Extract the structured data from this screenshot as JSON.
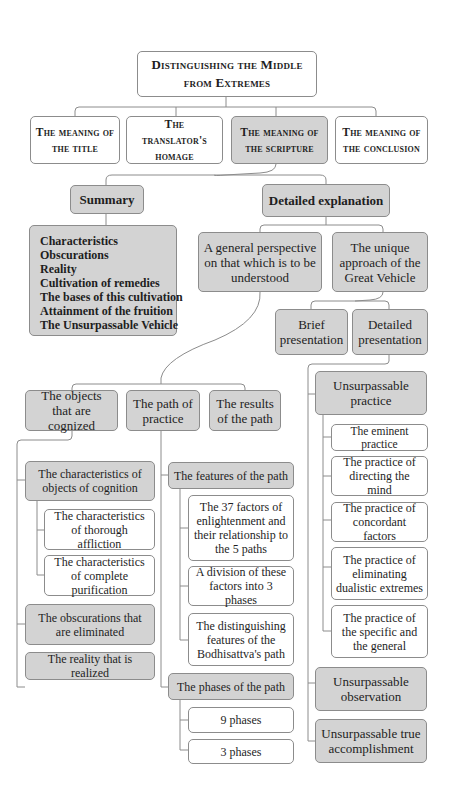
{
  "title": "Distinguishing the Middle from Extremes",
  "level1": [
    {
      "label": "The meaning of the title"
    },
    {
      "label": "The translator's homage"
    },
    {
      "label": "The meaning of the scripture"
    },
    {
      "label": "The meaning of the conclusion"
    }
  ],
  "scripture": {
    "summary": {
      "label": "Summary",
      "items": [
        "Characteristics",
        "Obscurations",
        "Reality",
        "Cultivation of remedies",
        "The bases of this cultivation",
        "Attainment of the fruition",
        "The Unsurpassable Vehicle"
      ]
    },
    "detailed": {
      "label": "Detailed explanation",
      "general": {
        "label": "A general perspective on that which is to be understood",
        "objects": {
          "label": "The objects that are cognized",
          "children": [
            {
              "label": "The characteristics of objects of cognition",
              "children": [
                {
                  "label": "The characteristics of thorough affliction"
                },
                {
                  "label": "The characteristics of complete purification"
                }
              ]
            },
            {
              "label": "The obscurations that are eliminated"
            },
            {
              "label": "The reality that is realized"
            }
          ]
        },
        "path": {
          "label": "The path of practice",
          "features": {
            "label": "The features of the path",
            "children": [
              {
                "label": "The 37 factors of enlightenment and their relationship to the 5 paths"
              },
              {
                "label": "A division of these factors into 3 phases"
              },
              {
                "label": "The distinguishing features of the Bodhisattva's path"
              }
            ]
          },
          "phases": {
            "label": "The phases of the path",
            "children": [
              {
                "label": "9 phases"
              },
              {
                "label": "3 phases"
              }
            ]
          }
        },
        "results": {
          "label": "The results of the path"
        }
      },
      "unique": {
        "label": "The unique approach of the Great Vehicle",
        "brief": {
          "label": "Brief presentation"
        },
        "detailed_presentation": {
          "label": "Detailed presentation"
        },
        "practice": {
          "label": "Unsurpassable practice",
          "children": [
            {
              "label": "The eminent practice"
            },
            {
              "label": "The practice of directing the mind"
            },
            {
              "label": "The practice of concordant factors"
            },
            {
              "label": "The practice of eliminating dualistic extremes"
            },
            {
              "label": "The practice of the specific and the general"
            }
          ]
        },
        "observation": {
          "label": "Unsurpassable observation"
        },
        "accomplishment": {
          "label": "Unsurpassable true accomplishment"
        }
      }
    }
  },
  "colors": {
    "grey_fill": "#d3d3d3",
    "white_fill": "#ffffff",
    "border": "#8c8c8c",
    "text": "#1e1e1e"
  }
}
